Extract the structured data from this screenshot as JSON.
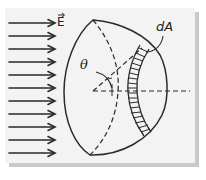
{
  "figure": {
    "labels": {
      "field": "E",
      "area_element": "dA",
      "angle": "θ"
    },
    "field_arrows": {
      "count": 11,
      "direction": "right"
    },
    "colors": {
      "ink": "#2a2a2a",
      "background": "#f3f3f3",
      "shadow": "#c9c9c9"
    }
  }
}
